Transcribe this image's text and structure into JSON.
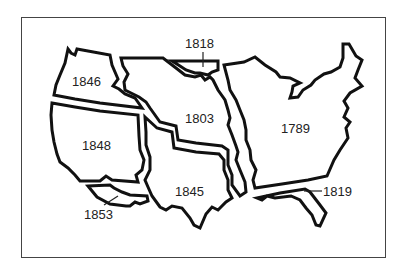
{
  "map": {
    "title": "",
    "regions": [
      {
        "id": "1789",
        "label": "1789"
      },
      {
        "id": "1803",
        "label": "1803"
      },
      {
        "id": "1818",
        "label": "1818"
      },
      {
        "id": "1819",
        "label": "1819"
      },
      {
        "id": "1845",
        "label": "1845"
      },
      {
        "id": "1846",
        "label": "1846"
      },
      {
        "id": "1848",
        "label": "1848"
      },
      {
        "id": "1853",
        "label": "1853"
      }
    ],
    "colors": {
      "outline": "#111111",
      "frame": "#444444",
      "fill": "#ffffff",
      "text": "#222222"
    }
  }
}
